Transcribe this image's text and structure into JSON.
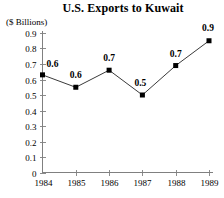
{
  "chart_data": {
    "type": "line",
    "title": "U.S. Exports to Kuwait",
    "ylabel": "($ Billions)",
    "xlabel": "",
    "categories": [
      "1984",
      "1985",
      "1986",
      "1987",
      "1988",
      "1989"
    ],
    "values": [
      0.63,
      0.55,
      0.66,
      0.5,
      0.69,
      0.85
    ],
    "point_labels": [
      "0.6",
      "0.6",
      "0.7",
      "0.5",
      "0.7",
      "0.9"
    ],
    "ylim": [
      0,
      0.9
    ],
    "ytick_labels": [
      "0.9",
      "0.8",
      "0.7",
      "0.6",
      "0.5",
      "0.4",
      "0.3",
      "0.2",
      "0.1",
      "0"
    ],
    "ytick_values": [
      0.9,
      0.8,
      0.7,
      0.6,
      0.5,
      0.4,
      0.3,
      0.2,
      0.1,
      0
    ],
    "grid": false,
    "legend": false,
    "marker": "filled-square",
    "line_color": "#3a3a3a",
    "marker_color": "#000000",
    "axis_color": "#808080",
    "background": "#ffffff"
  }
}
